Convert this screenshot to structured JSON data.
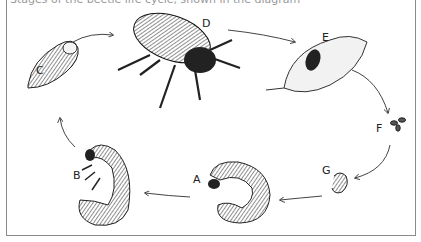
{
  "caption": "Stages of the beetle life cycle, shown in the diagram",
  "diagram": {
    "title": "Beetle life cycle",
    "stages": [
      {
        "label": "A",
        "name": "large grub (larva)"
      },
      {
        "label": "B",
        "name": "mature grub (larva)"
      },
      {
        "label": "C",
        "name": "pupa"
      },
      {
        "label": "D",
        "name": "adult beetle"
      },
      {
        "label": "E",
        "name": "beetle on leaf"
      },
      {
        "label": "F",
        "name": "eggs"
      },
      {
        "label": "G",
        "name": "young grub (larva)"
      }
    ],
    "cycle_order": [
      "G",
      "A",
      "B",
      "C",
      "D",
      "E",
      "F",
      "G"
    ]
  }
}
